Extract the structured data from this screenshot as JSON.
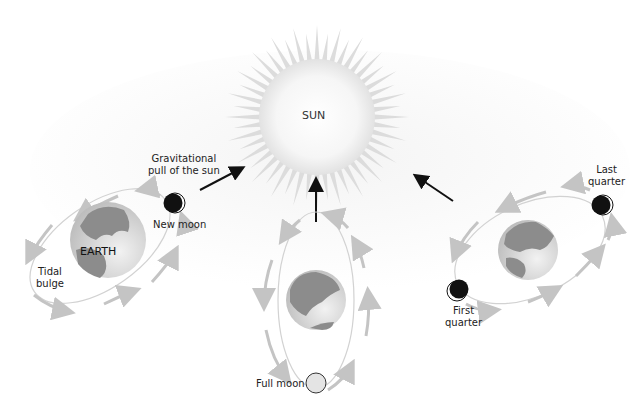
{
  "diagram": {
    "sun": {
      "label": "SUN"
    },
    "gravity_label": {
      "line1": "Gravitational",
      "line2": "pull of the sun"
    },
    "earth_label": "EARTH",
    "tidal_bulge": {
      "line1": "Tidal",
      "line2": "bulge"
    },
    "moons": [
      {
        "phase": "new",
        "label": "New moon"
      },
      {
        "phase": "full",
        "label": "Full moon"
      },
      {
        "phase": "first",
        "line1": "First",
        "line2": "quarter"
      },
      {
        "phase": "last",
        "line1": "Last",
        "line2": "quarter"
      }
    ],
    "colors": {
      "sun_fill": "#f4f4f4",
      "sun_rays": "#dcdcdc",
      "earth_land": "#8c8c8c",
      "earth_ocean": "#d6d6d6",
      "orbit_line": "#d2d2d2",
      "orbit_arrow": "#c4c4c4",
      "pull_arrow": "#111111",
      "moon_dark": "#111111"
    }
  }
}
